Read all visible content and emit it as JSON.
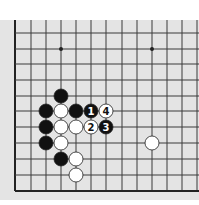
{
  "diagram": {
    "type": "go-board-corner",
    "colors": {
      "board_bg": "#e4e4e4",
      "line": "#3a3a3a",
      "border": "#222222",
      "black_stone": "#111111",
      "white_stone": "#ffffff",
      "stone_outline": "#222222"
    },
    "grid": {
      "columns_x": [
        15,
        31,
        46,
        61,
        76,
        91,
        106,
        122,
        137,
        152,
        167,
        182,
        197
      ],
      "rows_y": [
        33,
        49,
        64,
        80,
        96,
        111,
        127,
        143,
        159,
        175,
        191
      ],
      "left_border_x": 15,
      "bottom_border_y": 191,
      "top_y": 20,
      "right_x": 199
    },
    "star_points": [
      {
        "x": 61,
        "y": 49
      },
      {
        "x": 152,
        "y": 49
      }
    ],
    "stones": [
      {
        "color": "black",
        "x": 61,
        "y": 96,
        "label": ""
      },
      {
        "color": "black",
        "x": 46,
        "y": 111,
        "label": ""
      },
      {
        "color": "white",
        "x": 61,
        "y": 111,
        "label": ""
      },
      {
        "color": "black",
        "x": 76,
        "y": 111,
        "label": ""
      },
      {
        "color": "black",
        "x": 91,
        "y": 111,
        "label": "1"
      },
      {
        "color": "white",
        "x": 106,
        "y": 111,
        "label": "4"
      },
      {
        "color": "black",
        "x": 46,
        "y": 127,
        "label": ""
      },
      {
        "color": "white",
        "x": 61,
        "y": 127,
        "label": ""
      },
      {
        "color": "white",
        "x": 76,
        "y": 127,
        "label": ""
      },
      {
        "color": "white",
        "x": 91,
        "y": 127,
        "label": "2"
      },
      {
        "color": "black",
        "x": 106,
        "y": 127,
        "label": "3"
      },
      {
        "color": "black",
        "x": 46,
        "y": 143,
        "label": ""
      },
      {
        "color": "white",
        "x": 61,
        "y": 143,
        "label": ""
      },
      {
        "color": "white",
        "x": 152,
        "y": 143,
        "label": ""
      },
      {
        "color": "black",
        "x": 61,
        "y": 159,
        "label": ""
      },
      {
        "color": "white",
        "x": 76,
        "y": 159,
        "label": ""
      },
      {
        "color": "white",
        "x": 76,
        "y": 175,
        "label": ""
      }
    ]
  }
}
